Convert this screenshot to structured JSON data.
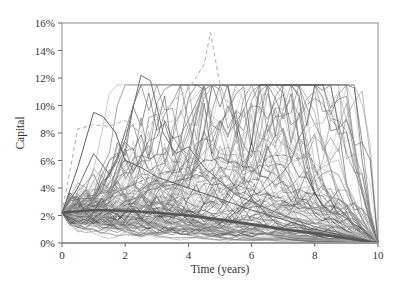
{
  "chart_data": {
    "type": "line",
    "title": "",
    "xlabel": "Time (years)",
    "ylabel": "Capital",
    "xlim": [
      0,
      10
    ],
    "ylim": [
      0,
      16
    ],
    "x_ticks": [
      0,
      2,
      4,
      6,
      8,
      10
    ],
    "x_tick_labels": [
      "0",
      "2",
      "4",
      "6",
      "8",
      "10"
    ],
    "y_ticks": [
      0,
      2,
      4,
      6,
      8,
      10,
      12,
      14,
      16
    ],
    "y_tick_labels": [
      "0%",
      "2%",
      "4%",
      "6%",
      "8%",
      "10%",
      "12%",
      "14%",
      "16%"
    ],
    "grid": false,
    "legend": null,
    "series": [
      {
        "name": "Average capital",
        "style": "thick-solid",
        "color": "#555555",
        "x": [
          0,
          1,
          2,
          3,
          4,
          5,
          6,
          7,
          8,
          9,
          10
        ],
        "values": [
          2.2,
          2.4,
          2.35,
          2.2,
          2.0,
          1.7,
          1.35,
          1.0,
          0.7,
          0.35,
          0.0
        ]
      },
      {
        "name": "Highlighted path (dashed peak)",
        "style": "dashed",
        "color": "#b0b0b0",
        "x": [
          0,
          0.5,
          1,
          1.5,
          2,
          2.5,
          3,
          3.5,
          4,
          4.5,
          4.7,
          5,
          5.3,
          5.6,
          6,
          6.5,
          7,
          7.5,
          8,
          8.5,
          9,
          9.5,
          10
        ],
        "values": [
          2.2,
          8.3,
          8.6,
          8.5,
          8.9,
          8.0,
          9.0,
          10.3,
          11.2,
          13.0,
          15.3,
          11.5,
          10.0,
          6.5,
          5.0,
          4.2,
          4.0,
          3.5,
          2.8,
          2.0,
          1.3,
          0.6,
          0.0
        ]
      },
      {
        "name": "Highlighted path (solid peak)",
        "style": "solid",
        "color": "#707070",
        "x": [
          0,
          0.5,
          1,
          1.5,
          2,
          2.5,
          2.8,
          3.2,
          3.6,
          4,
          4.5,
          5,
          5.5,
          6,
          7,
          8,
          9,
          10
        ],
        "values": [
          2.2,
          4.0,
          6.5,
          5.0,
          7.5,
          12.2,
          11.8,
          8.0,
          6.5,
          7.0,
          5.5,
          4.5,
          3.5,
          3.0,
          2.0,
          1.2,
          0.6,
          0.0
        ]
      },
      {
        "name": "Highlighted path (late dashed)",
        "style": "dashed",
        "color": "#808080",
        "x": [
          0,
          1,
          2,
          3,
          4,
          5,
          5.5,
          6,
          6.5,
          7,
          7.5,
          7.8,
          8.2,
          8.6,
          9,
          9.5,
          10
        ],
        "values": [
          2.2,
          3.5,
          4.0,
          5.0,
          5.5,
          4.5,
          3.6,
          3.8,
          6.3,
          6.4,
          6.1,
          6.6,
          4.5,
          3.0,
          1.8,
          0.8,
          0.0
        ]
      },
      {
        "name": "Highlighted path (early peak)",
        "style": "solid",
        "color": "#606060",
        "x": [
          0,
          0.5,
          1,
          1.3,
          1.7,
          2,
          2.5,
          3,
          4,
          5,
          6,
          7,
          8,
          9,
          10
        ],
        "values": [
          2.2,
          5.5,
          9.5,
          9.2,
          8.0,
          6.0,
          5.5,
          4.8,
          4.0,
          3.2,
          2.4,
          1.7,
          1.0,
          0.5,
          0.0
        ]
      }
    ],
    "simulated_paths": {
      "count": 120,
      "start_value": 2.2,
      "end_value": 0.0,
      "colors": [
        "#4a4a4a",
        "#6a6a6a",
        "#8a8a8a",
        "#a8a8a8",
        "#c4c4c4"
      ]
    }
  },
  "layout": {
    "plot_left": 62,
    "plot_top": 23,
    "plot_right": 378,
    "plot_bottom": 243
  }
}
